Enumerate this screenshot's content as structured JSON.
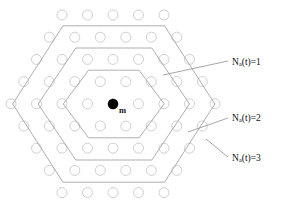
{
  "figure": {
    "name": "hexagonal-cell-cluster",
    "background_color": "#ffffff",
    "width": 281,
    "height": 211
  },
  "center_marker": {
    "label": "m",
    "color": "#050505",
    "radius": 5.2,
    "x": 113,
    "y": 104
  },
  "lattice": {
    "circle_radius": 5.0,
    "stroke_color": "#c9c9c9",
    "fill_color": "#ffffff",
    "col_spacing": 25.5,
    "row_spacing": 22.2,
    "rows": [
      {
        "count": 5,
        "x_start": 62.0,
        "y": 15.0
      },
      {
        "count": 6,
        "x_start": 49.3,
        "y": 37.2
      },
      {
        "count": 7,
        "x_start": 36.5,
        "y": 59.4
      },
      {
        "count": 8,
        "x_start": 23.8,
        "y": 81.6
      },
      {
        "count": 9,
        "x_start": 11.0,
        "y": 103.8
      },
      {
        "count": 8,
        "x_start": 23.8,
        "y": 126.0
      },
      {
        "count": 7,
        "x_start": 36.5,
        "y": 148.2
      },
      {
        "count": 6,
        "x_start": 49.3,
        "y": 170.4
      },
      {
        "count": 5,
        "x_start": 62.0,
        "y": 192.6
      }
    ]
  },
  "hex_rings": [
    {
      "id": "ring-1",
      "tier": 1,
      "points": "88.5,70.2 139.0,70.2 164.2,104.0 139.0,137.8 88.5,137.8 63.3,104.0",
      "stroke_color": "#9a9a9a"
    },
    {
      "id": "ring-2",
      "tier": 2,
      "points": "75.8,48.0 151.8,48.0 189.5,104.0 151.8,160.0 75.8,160.0 38.1,104.0",
      "stroke_color": "#9a9a9a"
    },
    {
      "id": "ring-3",
      "tier": 3,
      "points": "63.0,25.8 164.5,25.8 214.8,104.0 164.5,182.2 63.0,182.2 12.7,104.0",
      "stroke_color": "#9a9a9a"
    }
  ],
  "annotations": [
    {
      "id": "annotation-1",
      "symbol": "N",
      "subscript": "a",
      "argument": "(t)=1",
      "full_text": "Na(t)=1",
      "text_x": 232.0,
      "text_y": 62.5,
      "leader": "163.0,75.0 228.0,61.0"
    },
    {
      "id": "annotation-2",
      "symbol": "N",
      "subscript": "a",
      "argument": "(t)=2",
      "full_text": "Na(t)=2",
      "text_x": 232.0,
      "text_y": 119.0,
      "leader": "188.0,132.0 228.0,118.0"
    },
    {
      "id": "annotation-3",
      "symbol": "N",
      "subscript": "a",
      "argument": "(t)=3",
      "full_text": "Na(t)=3",
      "text_x": 232.0,
      "text_y": 158.5,
      "leader": "206.0,139.0 228.0,157.0"
    }
  ]
}
